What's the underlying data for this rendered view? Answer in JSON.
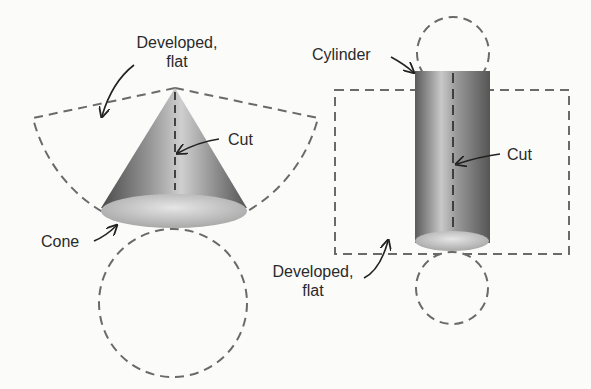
{
  "labels": {
    "cone_developed_line1": "Developed,",
    "cone_developed_line2": "flat",
    "cone_cut": "Cut",
    "cone": "Cone",
    "cylinder": "Cylinder",
    "cylinder_cut": "Cut",
    "cylinder_developed_line1": "Developed,",
    "cylinder_developed_line2": "flat"
  },
  "colors": {
    "background": "#fbfbfa",
    "dash": "#6a6a6a",
    "text": "#2a2a2a",
    "shape_dark": "#5a5a5a",
    "shape_light": "#d8d8d8"
  }
}
